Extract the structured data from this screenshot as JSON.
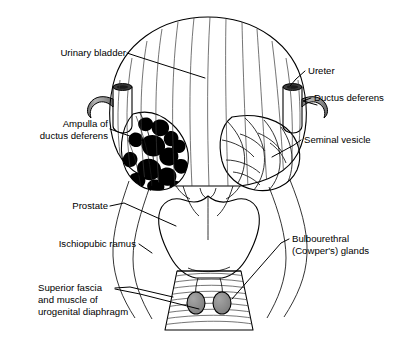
{
  "figure": {
    "type": "anatomical-illustration",
    "background_color": "#ffffff",
    "line_color": "#000000"
  },
  "labels": {
    "urinary_bladder": "Urinary bladder",
    "ureter": "Ureter",
    "ductus_deferens": "Ductus deferens",
    "ampulla_line1": "Ampulla of",
    "ampulla_line2": "ductus deferens",
    "seminal_vesicle": "Seminal vesicle",
    "prostate": "Prostate",
    "ischiopubic_ramus": "Ischiopubic ramus",
    "bulbourethral_line1": "Bulbourethral",
    "bulbourethral_line2": "(Cowper's) glands",
    "superior_fascia_line1": "Superior fascia",
    "superior_fascia_line2": "and muscle of",
    "superior_fascia_line3": "urogenital diaphragm"
  },
  "structures": {
    "bladder": {
      "name": "urinary bladder",
      "fill_top": "#fbfbfb",
      "fill_bottom": "#8f8f8f"
    },
    "ureter_left": {
      "name": "left ureter",
      "fill": "#9a9a9a",
      "cut_end": "#3c3c3c"
    },
    "ureter_right": {
      "name": "right ureter",
      "fill": "#9a9a9a",
      "cut_end": "#3c3c3c"
    },
    "ductus_deferens_left": {
      "name": "left ductus deferens",
      "fill": "#9a9a9a"
    },
    "ductus_deferens_right": {
      "name": "right ductus deferens",
      "fill": "#9a9a9a"
    },
    "ampulla": {
      "name": "ampulla of ductus deferens",
      "fill": "#ffffff",
      "lumen": "#000000"
    },
    "seminal_vesicle": {
      "name": "seminal vesicle",
      "fill": "#a8a8a8"
    },
    "prostate": {
      "name": "prostate gland",
      "fill": "#a6a6a6"
    },
    "urogenital_diaphragm": {
      "name": "urogenital diaphragm",
      "fill": "#cfcfcf"
    },
    "bulbourethral_glands": {
      "name": "bulbourethral (Cowper's) glands",
      "fill": "#8d8d8d",
      "count": 2
    },
    "ischiopubic_ramus_left": {
      "name": "left ischiopubic ramus",
      "fill": "none"
    },
    "ischiopubic_ramus_right": {
      "name": "right ischiopubic ramus",
      "fill": "none"
    }
  }
}
